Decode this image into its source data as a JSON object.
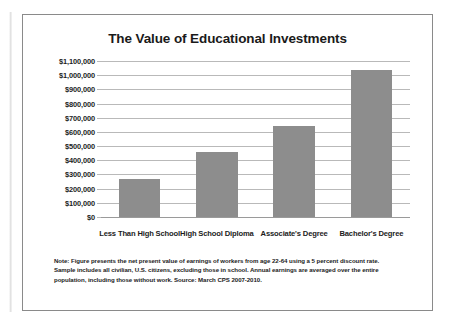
{
  "chart_data": {
    "type": "bar",
    "title": "The Value of Educational Investments",
    "categories": [
      "Less Than High School",
      "High School Diploma",
      "Associate's Degree",
      "Bachelor's Degree"
    ],
    "values": [
      265000,
      460000,
      640000,
      1035000
    ],
    "xlabel": "",
    "ylabel": "",
    "ylim": [
      0,
      1100000
    ],
    "ytick_values": [
      0,
      100000,
      200000,
      300000,
      400000,
      500000,
      600000,
      700000,
      800000,
      900000,
      1000000,
      1100000
    ],
    "ytick_labels": [
      "$0",
      "$100,000",
      "$200,000",
      "$300,000",
      "$400,000",
      "$500,000",
      "$600,000",
      "$700,000",
      "$800,000",
      "$900,000",
      "$1,000,000",
      "$1,100,000"
    ],
    "grid": true,
    "legend": false,
    "bar_color": "#8d8d8d",
    "gridline_color": "#b9b9b9"
  },
  "footnote": {
    "text": "Note: Figure presents the net present value of earnings of workers from age 22-64 using a 5 percent discount rate. Sample includes all civilian, U.S. citizens, excluding those in school. Annual earnings are averaged over the entire population, including those without work. Source: March CPS 2007-2010."
  }
}
